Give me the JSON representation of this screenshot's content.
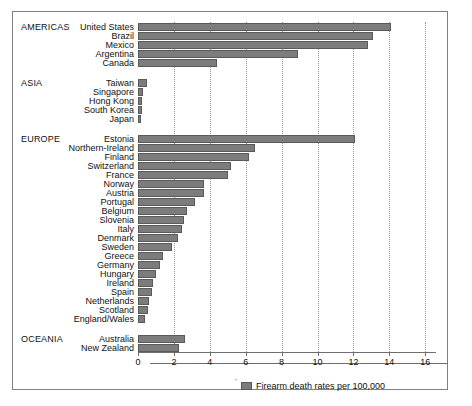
{
  "chart_data": {
    "type": "bar",
    "orientation": "horizontal",
    "title": "",
    "xlabel": "Firearm death rates per 100,000",
    "ylabel": "",
    "xlim": [
      0,
      16.6
    ],
    "xticks": [
      0,
      2,
      4,
      6,
      8,
      10,
      12,
      14,
      16
    ],
    "xticklabels": [
      "0",
      "2",
      "4",
      "6",
      "8",
      "10",
      "12",
      "14",
      "16"
    ],
    "grid": "vertical-dotted",
    "legend": {
      "position": "below-axis",
      "entries": [
        "Firearm death rates per 100,000"
      ]
    },
    "groups": [
      {
        "name": "AMERICAS",
        "categories": [
          "United States",
          "Brazil",
          "Mexico",
          "Argentina",
          "Canada"
        ],
        "values": [
          14.1,
          13.1,
          12.8,
          8.9,
          4.4
        ]
      },
      {
        "name": "ASIA",
        "categories": [
          "Taiwan",
          "Singapore",
          "Hong Kong",
          "South Korea",
          "Japan"
        ],
        "values": [
          0.5,
          0.3,
          0.25,
          0.2,
          0.1
        ]
      },
      {
        "name": "EUROPE",
        "categories": [
          "Estonia",
          "Northern-Ireland",
          "Finland",
          "Switzerland",
          "France",
          "Norway",
          "Austria",
          "Portugal",
          "Belgium",
          "Slovenia",
          "Italy",
          "Denmark",
          "Sweden",
          "Greece",
          "Germany",
          "Hungary",
          "Ireland",
          "Spain",
          "Netherlands",
          "Scotland",
          "England/Wales"
        ],
        "values": [
          12.1,
          6.5,
          6.2,
          5.2,
          5.0,
          3.7,
          3.65,
          3.15,
          2.75,
          2.55,
          2.45,
          2.25,
          1.9,
          1.4,
          1.25,
          1.0,
          0.85,
          0.8,
          0.6,
          0.55,
          0.4
        ]
      },
      {
        "name": "OCEANIA",
        "categories": [
          "Australia",
          "New Zealand"
        ],
        "values": [
          2.6,
          2.3
        ]
      }
    ]
  },
  "style": {
    "bar_color": "#7c7c7c",
    "bar_border": "#5a5a5a",
    "grid_color": "#9a9a9a",
    "frame_color": "#808080",
    "text_color": "#111111",
    "background": "#ffffff"
  }
}
